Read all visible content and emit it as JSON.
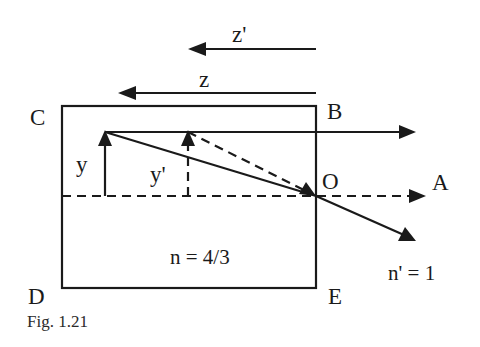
{
  "figure": {
    "caption": "Fig. 1.21"
  },
  "labels": {
    "corner_c": "C",
    "corner_b": "B",
    "corner_d": "D",
    "corner_e": "E",
    "point_o": "O",
    "point_a": "A",
    "object_height": "y",
    "image_height": "y'",
    "object_distance": "z",
    "image_distance": "z'",
    "medium_index": "n = 4/3",
    "outside_index": "n' = 1"
  },
  "geometry": {
    "block": {
      "left": 62,
      "top": 106,
      "right": 316,
      "bottom": 288
    },
    "axis_y": 196,
    "surface_x": 316,
    "object_x": 105,
    "image_x": 188,
    "ray_top_y": 132
  },
  "colors": {
    "ink": "#1a1a1a",
    "background": "#ffffff"
  }
}
